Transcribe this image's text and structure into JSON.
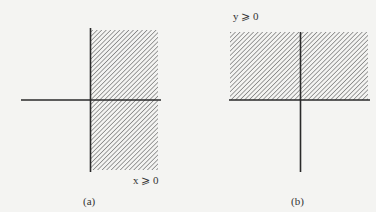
{
  "figure": {
    "panels": [
      {
        "id": "a",
        "caption": "(a)",
        "inequality_label": "x ⩾ 0",
        "shaded_region": "right half-plane"
      },
      {
        "id": "b",
        "caption": "(b)",
        "inequality_label": "y ⩾ 0",
        "shaded_region": "upper half-plane"
      }
    ]
  },
  "colors": {
    "background": "#f4f4f2",
    "axis": "#2a2a2a",
    "hatch": "#555555"
  }
}
